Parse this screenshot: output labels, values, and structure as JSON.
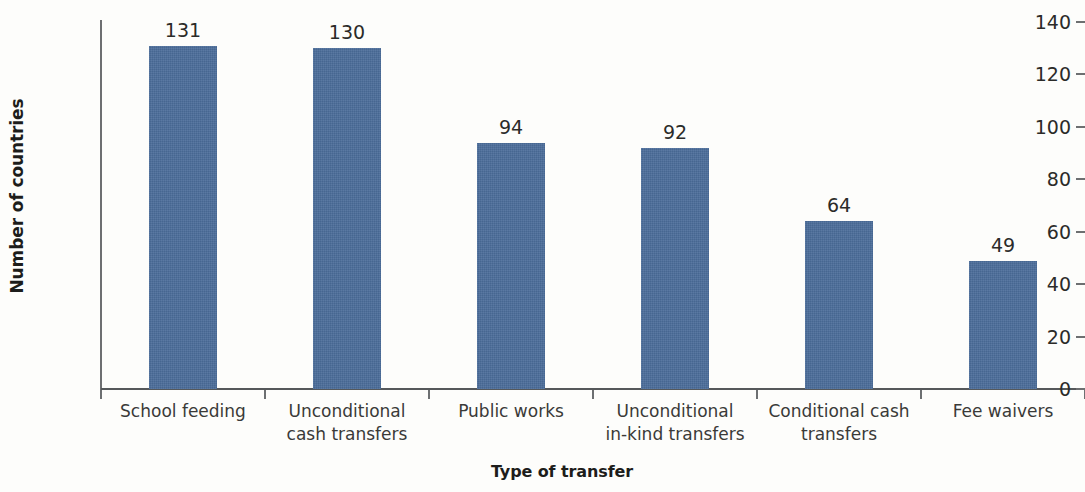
{
  "chart_data": {
    "type": "bar",
    "title": "",
    "xlabel": "Type of transfer",
    "ylabel": "Number of countries",
    "categories": [
      "School feeding",
      "Unconditional cash transfers",
      "Public works",
      "Unconditional in-kind transfers",
      "Conditional cash transfers",
      "Fee waivers"
    ],
    "category_lines": [
      [
        "School feeding"
      ],
      [
        "Unconditional",
        "cash transfers"
      ],
      [
        "Public works"
      ],
      [
        "Unconditional",
        "in-kind transfers"
      ],
      [
        "Conditional cash",
        "transfers"
      ],
      [
        "Fee waivers"
      ]
    ],
    "values": [
      131,
      130,
      94,
      92,
      64,
      49
    ],
    "value_labels": [
      "131",
      "130",
      "94",
      "92",
      "64",
      "49"
    ],
    "ylim": [
      0,
      140
    ],
    "ytick_values": [
      0,
      20,
      40,
      60,
      80,
      100,
      120,
      140
    ],
    "ytick_labels": [
      "0",
      "20",
      "40",
      "60",
      "80",
      "100",
      "120",
      "140"
    ],
    "grid": false,
    "legend": false,
    "bar_color": "#4a6c99",
    "axis_color": "#6d6f71",
    "text_color": "#2b2b29",
    "background_color": "#fdfdfb"
  }
}
